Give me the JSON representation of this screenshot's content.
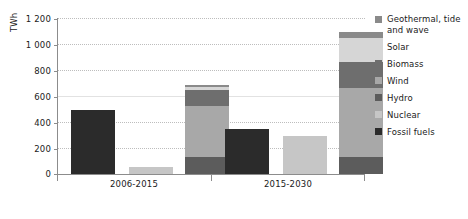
{
  "chart_data": {
    "type": "bar",
    "title": "",
    "xlabel": "",
    "ylabel": "TWh",
    "ylim": [
      0,
      1200
    ],
    "yticks": [
      0,
      200,
      400,
      600,
      800,
      1000,
      1200
    ],
    "ytick_labels": [
      "0",
      "200",
      "400",
      "600",
      "800",
      "1 000",
      "1 200"
    ],
    "grid": true,
    "stacked": true,
    "legend_position": "right",
    "categories": [
      "2006-2015",
      "2015-2030"
    ],
    "series": [
      {
        "name": "Geothermal, tide and wave",
        "color": "#8a8a8a",
        "values": [
          15,
          40
        ]
      },
      {
        "name": "Solar",
        "color": "#d6d6d6",
        "values": [
          25,
          190
        ]
      },
      {
        "name": "Biomass",
        "color": "#6e6e6e",
        "values": [
          125,
          200
        ]
      },
      {
        "name": "Wind",
        "color": "#a8a8a8",
        "values": [
          390,
          530
        ]
      },
      {
        "name": "Hydro",
        "color": "#5c5c5c",
        "values": [
          130,
          130
        ]
      },
      {
        "name": "Nuclear",
        "color": "#c6c6c6",
        "values": [
          55,
          290
        ]
      },
      {
        "name": "Fossil fuels",
        "color": "#2b2b2b",
        "values": [
          490,
          345
        ]
      }
    ],
    "bars": [
      {
        "group": "2006-2015",
        "name": "fossil-fuels-bar",
        "stack": [
          {
            "series": "Fossil fuels",
            "value": 490,
            "color": "#2b2b2b"
          }
        ],
        "total": 490
      },
      {
        "group": "2006-2015",
        "name": "nuclear-bar",
        "stack": [
          {
            "series": "Nuclear",
            "value": 55,
            "color": "#c6c6c6"
          }
        ],
        "total": 55
      },
      {
        "group": "2006-2015",
        "name": "renewables-bar",
        "stack": [
          {
            "series": "Hydro",
            "value": 130,
            "color": "#5c5c5c"
          },
          {
            "series": "Wind",
            "value": 390,
            "color": "#a8a8a8"
          },
          {
            "series": "Biomass",
            "value": 125,
            "color": "#6e6e6e"
          },
          {
            "series": "Solar",
            "value": 25,
            "color": "#d6d6d6"
          },
          {
            "series": "Geothermal, tide and wave",
            "value": 15,
            "color": "#8a8a8a"
          }
        ],
        "total": 685
      },
      {
        "group": "2015-2030",
        "name": "fossil-fuels-bar",
        "stack": [
          {
            "series": "Fossil fuels",
            "value": 345,
            "color": "#2b2b2b"
          }
        ],
        "total": 345
      },
      {
        "group": "2015-2030",
        "name": "nuclear-bar",
        "stack": [
          {
            "series": "Nuclear",
            "value": 290,
            "color": "#c6c6c6"
          }
        ],
        "total": 290
      },
      {
        "group": "2015-2030",
        "name": "renewables-bar",
        "stack": [
          {
            "series": "Hydro",
            "value": 130,
            "color": "#5c5c5c"
          },
          {
            "series": "Wind",
            "value": 530,
            "color": "#a8a8a8"
          },
          {
            "series": "Biomass",
            "value": 200,
            "color": "#6e6e6e"
          },
          {
            "series": "Solar",
            "value": 190,
            "color": "#d6d6d6"
          },
          {
            "series": "Geothermal, tide and wave",
            "value": 40,
            "color": "#8a8a8a"
          }
        ],
        "total": 1090
      }
    ]
  },
  "axis": {
    "y_title": "TWh",
    "y_tick_labels": [
      "1 200",
      "1 000",
      "800",
      "600",
      "400",
      "200",
      "0"
    ],
    "x_tick_labels": [
      "2006-2015",
      "2015-2030"
    ]
  },
  "legend": {
    "items": [
      {
        "label": "Geothermal, tide and wave",
        "color": "#8a8a8a"
      },
      {
        "label": "Solar",
        "color": "#d6d6d6"
      },
      {
        "label": "Biomass",
        "color": "#6e6e6e"
      },
      {
        "label": "Wind",
        "color": "#a8a8a8"
      },
      {
        "label": "Hydro",
        "color": "#5c5c5c"
      },
      {
        "label": "Nuclear",
        "color": "#c6c6c6"
      },
      {
        "label": "Fossil fuels",
        "color": "#2b2b2b"
      }
    ]
  }
}
